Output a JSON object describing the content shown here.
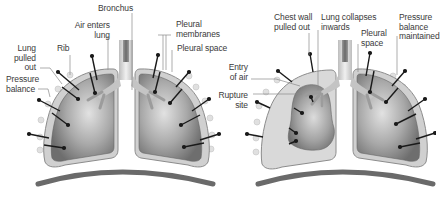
{
  "diagram": {
    "title": "",
    "colors": {
      "lung_dark": "#7a7a7a",
      "lung_light": "#d4d4d4",
      "pleura": "#cfcfcf",
      "pleura_outline": "#8c8c8c",
      "collapsed_space": "#d9d9d9",
      "bronchus": "#c8c8c8",
      "arrow": "#1a1a1a",
      "diaphragm": "#6a6a6a",
      "leader": "#8a8a8a",
      "text": "#3a3a3a"
    },
    "panels": [
      {
        "id": "normal",
        "labels": {
          "bronchus": "Bronchus",
          "air_enters_lung": "Air enters\nlung",
          "pleural_membranes": "Pleural\nmembranes",
          "pleural_space": "Pleural space",
          "rib": "Rib",
          "lung_pulled_out": "Lung\npulled\nout",
          "pressure_balance": "Pressure\nbalance"
        }
      },
      {
        "id": "pneumothorax",
        "labels": {
          "chest_wall_pulled_out": "Chest wall\npulled out",
          "lung_collapses_inwards": "Lung collapses\ninwards",
          "pleural_space": "Pleural\nspace",
          "pressure_balance_maintained": "Pressure\nbalance\nmaintained",
          "entry_of_air": "Entry\nof air",
          "rupture_site": "Rupture\nsite"
        }
      }
    ]
  }
}
